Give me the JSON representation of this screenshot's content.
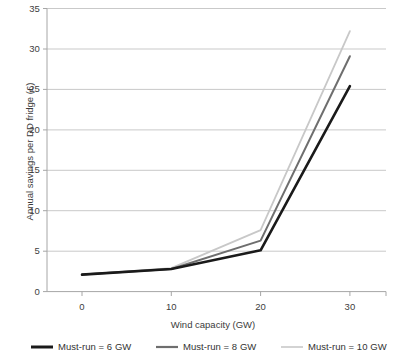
{
  "chart_data": {
    "type": "line",
    "title": "",
    "xlabel": "Wind capacity (GW)",
    "ylabel": "Annual savings per DD fridge (£)",
    "x": [
      0,
      10,
      20,
      30
    ],
    "xticklabels": [
      "0",
      "10",
      "20",
      "30"
    ],
    "yticklabels": [
      "0",
      "5",
      "10",
      "15",
      "20",
      "25",
      "30",
      "35"
    ],
    "yticks": [
      0,
      5,
      10,
      15,
      20,
      25,
      30,
      35
    ],
    "xlim": [
      -4,
      34
    ],
    "ylim": [
      0,
      35
    ],
    "grid": "horizontal",
    "legend_position": "bottom",
    "series": [
      {
        "name": "Must-run = 6 GW",
        "color": "#1a1a1a",
        "width": 2.6,
        "values": [
          2.1,
          2.8,
          5.1,
          25.4
        ]
      },
      {
        "name": "Must-run = 8 GW",
        "color": "#6e6e6e",
        "width": 2.0,
        "values": [
          2.1,
          2.8,
          6.3,
          29.1
        ]
      },
      {
        "name": "Must-run = 10 GW",
        "color": "#c8c8c8",
        "width": 1.8,
        "values": [
          2.1,
          2.9,
          7.6,
          32.2
        ]
      }
    ]
  },
  "axis": {
    "ylabel": "Annual savings per DD fridge (£)",
    "xlabel": "Wind capacity (GW)",
    "yticks": [
      "35",
      "30",
      "25",
      "20",
      "15",
      "10",
      "5",
      "0"
    ],
    "xticks": [
      "0",
      "10",
      "20",
      "30"
    ]
  },
  "legend": {
    "items": [
      {
        "label": "Must-run = 6 GW",
        "color": "#1a1a1a"
      },
      {
        "label": "Must-run = 8 GW",
        "color": "#6e6e6e"
      },
      {
        "label": "Must-run = 10 GW",
        "color": "#c8c8c8"
      }
    ]
  },
  "colors": {
    "gridline": "#c9c9c9",
    "axis": "#a6a6a6",
    "text": "#3b3b3b",
    "background": "#ffffff"
  }
}
